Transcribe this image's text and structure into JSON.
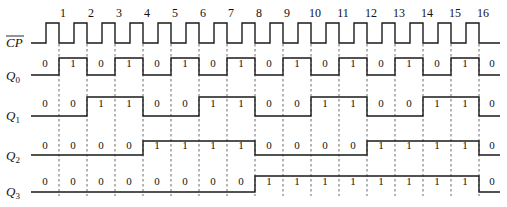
{
  "diagram": {
    "type": "timing-diagram",
    "edges": [
      1,
      2,
      3,
      4,
      5,
      6,
      7,
      8,
      9,
      10,
      11,
      12,
      13,
      14,
      15,
      16
    ],
    "signals": [
      {
        "name": "CP",
        "label": "CP",
        "overline": true,
        "kind": "clock"
      },
      {
        "name": "Q0",
        "label": "Q",
        "sub": "0",
        "bits": [
          0,
          1,
          0,
          1,
          0,
          1,
          0,
          1,
          0,
          1,
          0,
          1,
          0,
          1,
          0,
          1,
          0
        ]
      },
      {
        "name": "Q1",
        "label": "Q",
        "sub": "1",
        "bits": [
          0,
          0,
          1,
          1,
          0,
          0,
          1,
          1,
          0,
          0,
          1,
          1,
          0,
          0,
          1,
          1,
          0
        ]
      },
      {
        "name": "Q2",
        "label": "Q",
        "sub": "2",
        "bits": [
          0,
          0,
          0,
          0,
          1,
          1,
          1,
          1,
          0,
          0,
          0,
          0,
          1,
          1,
          1,
          1,
          0
        ]
      },
      {
        "name": "Q3",
        "label": "Q",
        "sub": "3",
        "bits": [
          0,
          0,
          0,
          0,
          0,
          0,
          0,
          0,
          1,
          1,
          1,
          1,
          1,
          1,
          1,
          1,
          0
        ]
      }
    ]
  }
}
